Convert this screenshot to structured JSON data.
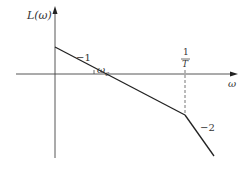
{
  "diagram": {
    "y_axis_label": "L(ω)",
    "x_axis_label": "ω",
    "crossover_label_base": "ω",
    "crossover_label_sub": "c",
    "break_freq_num": "1",
    "break_freq_den": "T",
    "slope_1_label": "−1",
    "slope_2_label": "−2",
    "colors": {
      "line": "#222222",
      "axis": "#444444",
      "dashed": "#666666",
      "text": "#333333"
    }
  }
}
